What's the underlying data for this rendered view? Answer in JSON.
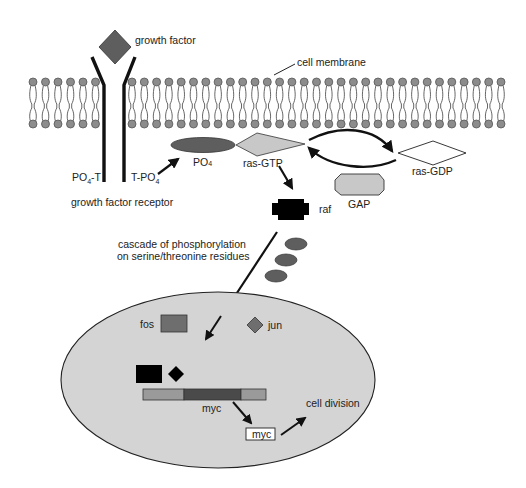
{
  "colors": {
    "background": "#ffffff",
    "ink": "#111111",
    "dark_gray": "#5e5e5e",
    "mid_gray": "#8a8a8a",
    "light_gray": "#c8c8c8",
    "nucleus_fill": "#d4d4d4",
    "lipid_head": "#8c8c8c"
  },
  "membrane": {
    "label": "cell membrane",
    "lipid_count_left": 6,
    "lipid_count_right": 31
  },
  "receptor": {
    "ligand_label": "growth factor",
    "receptor_label": "growth factor receptor",
    "left_tail_label": "PO4-T",
    "left_tail_label_parts": [
      "PO",
      "4",
      "-T"
    ],
    "right_tail_label": "T-PO4",
    "right_tail_label_parts": [
      "T-PO",
      "4"
    ]
  },
  "cytoplasm": {
    "po4_label": "PO4",
    "po4_label_parts": [
      "PO",
      "4"
    ],
    "ras_gtp_label": "ras-GTP",
    "ras_gdp_label": "ras-GDP",
    "gap_label": "GAP",
    "raf_label": "raf",
    "cascade_label_line1": "cascade of phosphorylation",
    "cascade_label_line2": "on serine/threonine residues"
  },
  "nucleus": {
    "fos_label": "fos",
    "jun_label": "jun",
    "gene_label": "myc",
    "protein_label": "myc",
    "outcome_label": "cell division"
  }
}
